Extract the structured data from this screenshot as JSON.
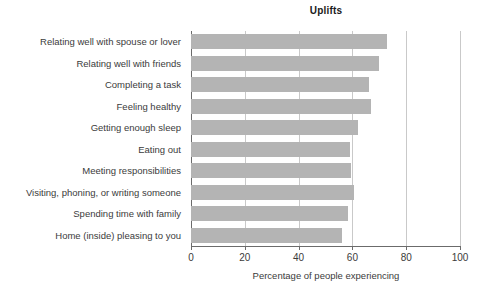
{
  "chart_data": {
    "type": "bar",
    "orientation": "horizontal",
    "title": "Uplifts",
    "xlabel": "Percentage of people experiencing",
    "ylabel": "",
    "xlim": [
      0,
      100
    ],
    "xticks": [
      0,
      20,
      40,
      60,
      80,
      100
    ],
    "xtick_labels": [
      "0",
      "20",
      "40",
      "60",
      "80",
      "100"
    ],
    "grid": "vertical",
    "legend": "none",
    "bar_color": "#b4b4b4",
    "grid_color": "#c9c9c9",
    "axis_color": "#6b6b6b",
    "text_color": "#3b3b3b",
    "categories": [
      "Relating well with spouse or lover",
      "Relating well with friends",
      "Completing a task",
      "Feeling healthy",
      "Getting enough sleep",
      "Eating out",
      "Meeting responsibilities",
      "Visiting, phoning, or writing someone",
      "Spending time with family",
      "Home (inside) pleasing to you"
    ],
    "values": [
      73,
      70,
      66,
      67,
      62,
      59,
      59.5,
      60.5,
      58.5,
      56
    ]
  }
}
